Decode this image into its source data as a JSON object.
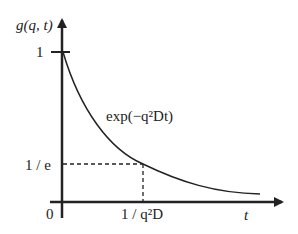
{
  "diagram": {
    "y_axis_label": "g(q, t)",
    "x_axis_label": "t",
    "origin_label": "0",
    "y_tick_one": "1",
    "y_tick_inv_e": "1 / e",
    "x_tick_tau": "1 / q²D",
    "curve_label": "exp(−q²Dt)",
    "curve_type": "exponential decay",
    "colors": {
      "line": "#222222",
      "background": "#ffffff"
    }
  }
}
